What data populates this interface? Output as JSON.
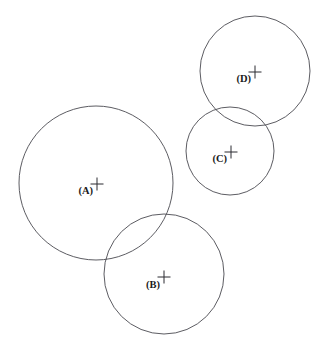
{
  "figure": {
    "type": "venn-circle-diagram",
    "background_color": "#ffffff",
    "stroke_color": "#4a4a50",
    "label_color": "#1a1a1a",
    "width": 323,
    "height": 361
  },
  "regions": [
    {
      "id": "A",
      "label": "(A)",
      "center_x": 96,
      "center_y": 183,
      "radius": 77,
      "marker": "plus",
      "marker_x": 97,
      "marker_y": 184,
      "marker_size": 13,
      "label_x": 93,
      "label_y": 194
    },
    {
      "id": "B",
      "label": "(B)",
      "center_x": 164,
      "center_y": 274,
      "radius": 60,
      "marker": "plus",
      "marker_x": 164,
      "marker_y": 277,
      "marker_size": 13,
      "label_x": 160,
      "label_y": 288
    },
    {
      "id": "C",
      "label": "(C)",
      "center_x": 230,
      "center_y": 151,
      "radius": 44,
      "marker": "plus",
      "marker_x": 231,
      "marker_y": 152,
      "marker_size": 13,
      "label_x": 227,
      "label_y": 162
    },
    {
      "id": "D",
      "label": "(D)",
      "center_x": 255,
      "center_y": 71,
      "radius": 55,
      "marker": "plus",
      "marker_x": 255,
      "marker_y": 72,
      "marker_size": 13,
      "label_x": 251,
      "label_y": 82
    }
  ],
  "chart_data": {
    "type": "scatter",
    "title": "",
    "xlabel": "",
    "ylabel": "",
    "series": [
      {
        "name": "region-centers",
        "points": [
          {
            "label": "(A)",
            "x": 96,
            "y": 183,
            "r": 77
          },
          {
            "label": "(B)",
            "x": 164,
            "y": 274,
            "r": 60
          },
          {
            "label": "(C)",
            "x": 230,
            "y": 151,
            "r": 44
          },
          {
            "label": "(D)",
            "x": 255,
            "y": 71,
            "r": 55
          }
        ]
      }
    ],
    "overlaps": [
      "A-B",
      "C-D"
    ],
    "grid": false,
    "legend": "none"
  }
}
